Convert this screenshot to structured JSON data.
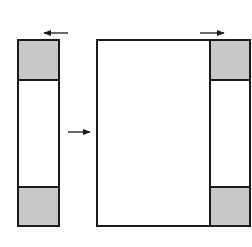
{
  "diagram": {
    "colors": {
      "stroke": "#1a1a1a",
      "shade": "#c8c8c8",
      "background": "#ffffff"
    },
    "shapes": {
      "left_strip": {
        "x": 18,
        "y": 40,
        "w": 41,
        "h": 186
      },
      "left_top_shade": {
        "x": 18,
        "y": 40,
        "w": 41,
        "h": 40
      },
      "left_bottom_shade": {
        "x": 18,
        "y": 187,
        "w": 41,
        "h": 39
      },
      "big_rect": {
        "x": 97,
        "y": 40,
        "w": 153,
        "h": 186
      },
      "right_divider_x": 210,
      "right_top_shade": {
        "x": 210,
        "y": 40,
        "w": 40,
        "h": 40
      },
      "right_bottom_shade": {
        "x": 210,
        "y": 187,
        "w": 40,
        "h": 39
      }
    },
    "arrows": [
      {
        "name": "top-left-arrow",
        "direction": "left",
        "x1": 68,
        "y1": 33,
        "x2": 44,
        "y2": 33
      },
      {
        "name": "middle-arrow",
        "direction": "right",
        "x1": 68,
        "y1": 132,
        "x2": 90,
        "y2": 132
      },
      {
        "name": "top-right-arrow",
        "direction": "right",
        "x1": 200,
        "y1": 33,
        "x2": 224,
        "y2": 33
      }
    ]
  }
}
